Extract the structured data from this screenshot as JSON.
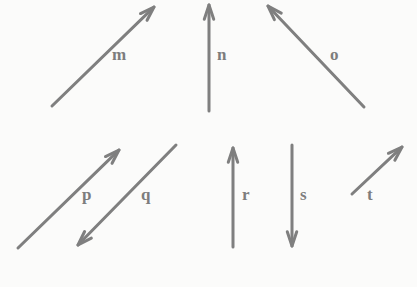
{
  "figure": {
    "title": "",
    "background_color": "#fbfbfa",
    "stroke_color": "#7f7f7f",
    "label_color": "#7d7d7d",
    "stroke_width": 3,
    "width": 417,
    "height": 287
  },
  "vectors": [
    {
      "label": "m",
      "name": "vector-m",
      "direction": "up-right",
      "tail": {
        "x": 52,
        "y": 106
      },
      "tip": {
        "x": 154,
        "y": 7
      },
      "label_pos": {
        "x": 112,
        "y": 46
      }
    },
    {
      "label": "n",
      "name": "vector-n",
      "direction": "up",
      "tail": {
        "x": 209,
        "y": 111
      },
      "tip": {
        "x": 209,
        "y": 5
      },
      "label_pos": {
        "x": 217,
        "y": 46
      }
    },
    {
      "label": "o",
      "name": "vector-o",
      "direction": "up-left",
      "tail": {
        "x": 364,
        "y": 107
      },
      "tip": {
        "x": 268,
        "y": 6
      },
      "label_pos": {
        "x": 330,
        "y": 46
      }
    },
    {
      "label": "p",
      "name": "vector-p",
      "direction": "up-right",
      "tail": {
        "x": 18,
        "y": 248
      },
      "tip": {
        "x": 119,
        "y": 150
      },
      "label_pos": {
        "x": 82,
        "y": 186
      }
    },
    {
      "label": "q",
      "name": "vector-q",
      "direction": "down-left",
      "tail": {
        "x": 176,
        "y": 145
      },
      "tip": {
        "x": 78,
        "y": 245
      },
      "label_pos": {
        "x": 141,
        "y": 186
      }
    },
    {
      "label": "r",
      "name": "vector-r",
      "direction": "up",
      "tail": {
        "x": 233,
        "y": 247
      },
      "tip": {
        "x": 233,
        "y": 148
      },
      "label_pos": {
        "x": 242,
        "y": 186
      }
    },
    {
      "label": "s",
      "name": "vector-s",
      "direction": "down",
      "tail": {
        "x": 292,
        "y": 145
      },
      "tip": {
        "x": 292,
        "y": 246
      },
      "label_pos": {
        "x": 300,
        "y": 186
      }
    },
    {
      "label": "t",
      "name": "vector-t",
      "direction": "up-right",
      "tail": {
        "x": 352,
        "y": 194
      },
      "tip": {
        "x": 402,
        "y": 147
      },
      "label_pos": {
        "x": 367,
        "y": 186
      }
    }
  ]
}
